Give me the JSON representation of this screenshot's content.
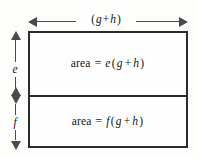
{
  "figure": {
    "type": "geometric-area-diagram",
    "colors": {
      "background": "#fdfdfc",
      "rect_border": "#2b2b2b",
      "rect_fill": "#fefefe",
      "arrow": "#4a4a4a",
      "text": "#151515"
    }
  },
  "width_dimension": {
    "name": "width-dimension",
    "label_open_paren": "(",
    "label_var1": "g",
    "label_plus": "+",
    "label_var2": "h",
    "label_close_paren": ")",
    "label_full": "( g + h )",
    "arrow_style": "double-headed-horizontal"
  },
  "height_dimensions": [
    {
      "name": "height-dimension-e",
      "label": "e",
      "arrow_style": "double-headed-vertical",
      "region": "top"
    },
    {
      "name": "height-dimension-f",
      "label": "f",
      "arrow_style": "double-headed-vertical",
      "region": "bottom"
    }
  ],
  "regions": [
    {
      "name": "upper-region",
      "area_word": "area",
      "equals": "=",
      "coefficient": "e",
      "open_paren": "(",
      "var1": "g",
      "plus": "+",
      "var2": "h",
      "close_paren": ")",
      "expression_full": "area = e( g + h)"
    },
    {
      "name": "lower-region",
      "area_word": "area",
      "equals": "=",
      "coefficient": "f",
      "open_paren": "(",
      "var1": "g",
      "plus": "+",
      "var2": "h",
      "close_paren": ")",
      "expression_full": "area = f( g + h)"
    }
  ]
}
